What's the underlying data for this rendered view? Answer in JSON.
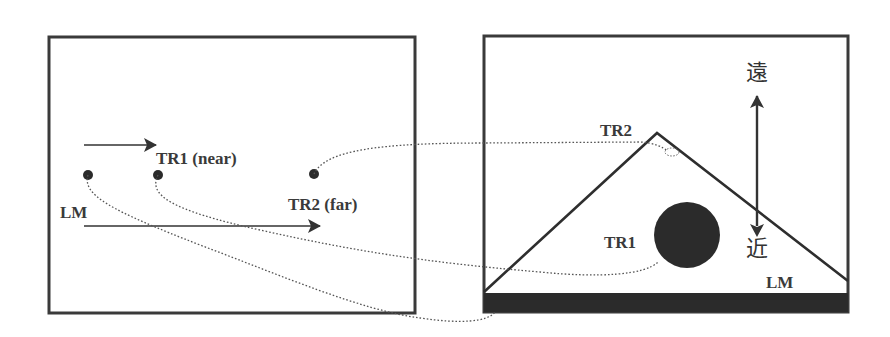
{
  "diagram": {
    "type": "spatial-relation-diagram",
    "left_panel": {
      "label_tr1": "TR1 (near)",
      "label_tr2": "TR2 (far)",
      "label_lm": "LM",
      "points": [
        {
          "id": "LM",
          "x": 88,
          "y": 175
        },
        {
          "id": "TR1",
          "x": 158,
          "y": 175
        },
        {
          "id": "TR2",
          "x": 314,
          "y": 174
        }
      ],
      "arrows": [
        {
          "id": "near-arrow",
          "from": [
            84,
            145
          ],
          "to": [
            156,
            145
          ]
        },
        {
          "id": "far-arrow",
          "from": [
            84,
            226
          ],
          "to": [
            320,
            226
          ]
        }
      ]
    },
    "right_panel": {
      "label_tr1": "TR1",
      "label_tr2": "TR2",
      "label_lm": "LM",
      "label_far": "遠",
      "label_near": "近",
      "triangle_apex": [
        657,
        133
      ],
      "circle": {
        "cx": 687,
        "cy": 235,
        "r": 33
      }
    },
    "colors": {
      "stroke": "#333333",
      "fill_dark": "#2b2b2b",
      "dotted": "#555555",
      "background": "#ffffff"
    }
  }
}
